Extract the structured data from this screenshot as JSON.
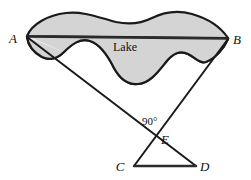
{
  "figure": {
    "background_color": "#ffffff",
    "lake": {
      "name_label": "Lake",
      "fill_color": "#d4d4d4",
      "outline_color": "#1a1a1a",
      "outline_width": 2.2
    },
    "chord": {
      "name": "segment-AB",
      "color": "#2b2b2b",
      "width": 2.6,
      "from": "A",
      "to": "B"
    },
    "vertices": [
      {
        "id": "A",
        "label": "A",
        "x": 27,
        "y": 37,
        "label_x": 13,
        "label_y": 43
      },
      {
        "id": "B",
        "label": "B",
        "x": 228,
        "y": 39,
        "label_x": 233,
        "label_y": 44
      },
      {
        "id": "C",
        "label": "C",
        "x": 134,
        "y": 166,
        "label_x": 120,
        "label_y": 171
      },
      {
        "id": "D",
        "label": "D",
        "x": 196,
        "y": 166,
        "label_x": 200,
        "label_y": 171
      },
      {
        "id": "E",
        "label": "E",
        "x": 156,
        "y": 137,
        "label_x": 161,
        "label_y": 144
      }
    ],
    "segments": [
      {
        "name": "segment-A-to-D",
        "from": "A",
        "to": "D",
        "color": "#1a1a1a",
        "width": 2.0
      },
      {
        "name": "segment-B-to-C",
        "from": "B",
        "to": "C",
        "color": "#1a1a1a",
        "width": 2.0
      },
      {
        "name": "segment-C-to-D",
        "from": "C",
        "to": "D",
        "color": "#2b2b2b",
        "width": 2.4
      }
    ],
    "angle": {
      "name": "right-angle-at-E",
      "label": "90°",
      "vertex": "E",
      "label_x": 142,
      "label_y": 125
    },
    "lake_outline_path": "M 27 36 C 32 24, 48 15, 66 13 C 84 11, 100 18, 116 22 C 130 25, 142 23, 152 18 C 164 12, 178 10, 192 14 C 206 18, 220 26, 228 38 L 27 36 Z",
    "lake_lower_path": "M 27 37 C 28 44, 33 52, 42 57 C 50 61, 58 58, 64 52 C 72 44, 80 38, 90 41 C 100 44, 108 56, 114 68 C 120 79, 128 85, 138 84 C 150 83, 158 72, 166 62 C 172 54, 180 50, 188 54 C 196 58, 200 64, 206 62 C 216 58, 224 48, 228 39",
    "lake_label_x": 113,
    "lake_label_y": 51
  }
}
